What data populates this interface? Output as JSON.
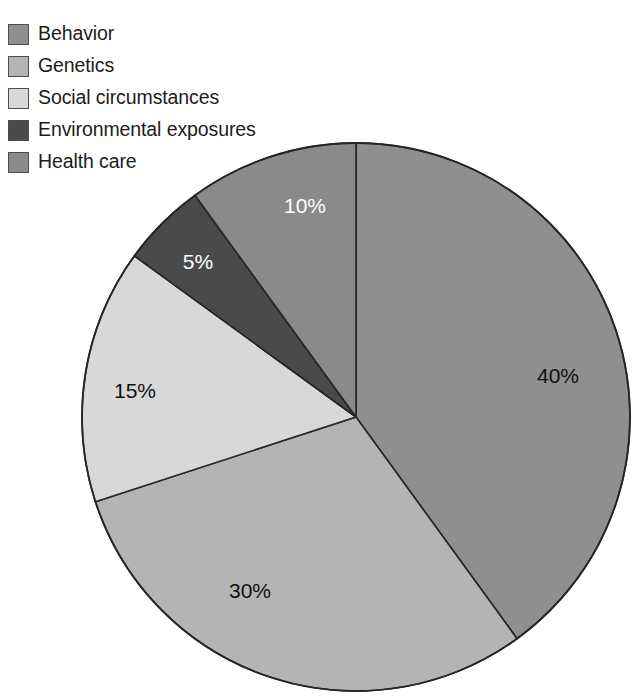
{
  "legend": {
    "items": [
      {
        "label": "Behavior",
        "color": "#8f8f8f",
        "swatch_name": "legend-swatch-behavior"
      },
      {
        "label": "Genetics",
        "color": "#b4b4b4",
        "swatch_name": "legend-swatch-genetics"
      },
      {
        "label": "Social circumstances",
        "color": "#d8d8d8",
        "swatch_name": "legend-swatch-social-circumstances"
      },
      {
        "label": "Environmental exposures",
        "color": "#4a4a4a",
        "swatch_name": "legend-swatch-environmental-exposures"
      },
      {
        "label": "Health care",
        "color": "#8a8a8a",
        "swatch_name": "legend-swatch-health-care"
      }
    ]
  },
  "chart_data": {
    "type": "pie",
    "title": "",
    "subtitle": "",
    "xlabel": "",
    "ylabel": "",
    "grid": false,
    "legend_position": "top-left",
    "start_angle_deg": 0,
    "direction": "clockwise",
    "center": {
      "x": 356,
      "y": 417
    },
    "radius": 274,
    "units": "percent",
    "total": 100,
    "categories": [
      "Behavior",
      "Genetics",
      "Social circumstances",
      "Environmental exposures",
      "Health care"
    ],
    "values": [
      40,
      30,
      15,
      5,
      10
    ],
    "slices": [
      {
        "name": "Behavior",
        "value": 40,
        "label": "40%",
        "color": "#8f8f8f",
        "label_color": "#111111",
        "label_x": 558,
        "label_y": 377
      },
      {
        "name": "Genetics",
        "value": 30,
        "label": "30%",
        "color": "#b4b4b4",
        "label_color": "#111111",
        "label_x": 250,
        "label_y": 592
      },
      {
        "name": "Social circumstances",
        "value": 15,
        "label": "15%",
        "color": "#d8d8d8",
        "label_color": "#111111",
        "label_x": 135,
        "label_y": 392
      },
      {
        "name": "Environmental exposures",
        "value": 5,
        "label": "5%",
        "color": "#4a4a4a",
        "label_color": "#ffffff",
        "label_x": 198,
        "label_y": 263
      },
      {
        "name": "Health care",
        "value": 10,
        "label": "10%",
        "color": "#8a8a8a",
        "label_color": "#ffffff",
        "label_x": 305,
        "label_y": 207
      }
    ]
  }
}
